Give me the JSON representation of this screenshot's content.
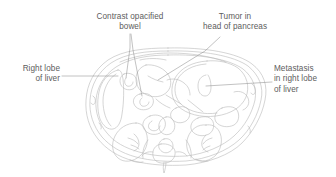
{
  "figure": {
    "kind": "axial-abdominal-ct-line-illustration",
    "background_color": "#ffffff",
    "line_color": "#b3b3b3",
    "leader_color": "#8c8c8c",
    "text_color": "#5d5d5d"
  },
  "labels": {
    "contrast_opacified_bowel": "Contrast opacified\nbowel",
    "tumor_head_of_pancreas": "Tumor in\nhead of pancreas",
    "right_lobe_of_liver": "Right lobe\nof liver",
    "metastasis_right_lobe": "Metastasis\nin right lobe\nof liver"
  }
}
